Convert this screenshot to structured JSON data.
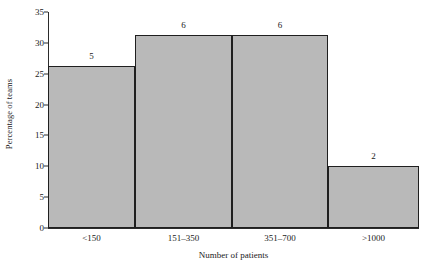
{
  "chart_data": {
    "type": "bar",
    "title": "",
    "subtitle": "",
    "xlabel": "Number of patients",
    "ylabel": "Percentage of teams",
    "categories": [
      "<150",
      "151–350",
      "351–700",
      ">1000"
    ],
    "values": [
      26.3,
      31.2,
      31.2,
      10.0
    ],
    "point_labels": [
      "5",
      "6",
      "6",
      "2"
    ],
    "ylim": [
      0,
      35
    ],
    "ytick_labels": [
      "0",
      "5",
      "10",
      "15",
      "20",
      "25",
      "30",
      "35"
    ],
    "ytick_values": [
      0,
      5,
      10,
      15,
      20,
      25,
      30,
      35
    ],
    "grid": false,
    "legend": null,
    "bar_gap": 0,
    "bar_edges": [
      0,
      87,
      184,
      280,
      371
    ],
    "colors": {
      "bar_fill": "#b9b9b9",
      "bar_edge": "#1f1f1f",
      "axis": "#2b2b2b",
      "text": "#1a1a1a",
      "background": "#ffffff"
    }
  }
}
